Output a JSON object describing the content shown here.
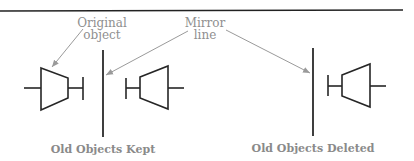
{
  "callouts": {
    "original_object": [
      "Original",
      "object"
    ],
    "mirror_line": [
      "Mirror",
      "line"
    ]
  },
  "captions": {
    "kept": "Old Objects Kept",
    "deleted": "Old Objects Deleted"
  },
  "colors": {
    "shape_stroke": "#262626",
    "label_text": "#8f8f8f",
    "arrow": "#9a9a9a"
  }
}
